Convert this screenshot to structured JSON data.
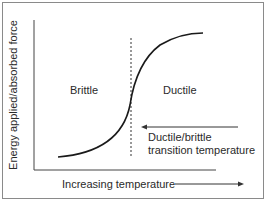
{
  "diagram": {
    "y_axis_label": "Energy applied/absorbed force",
    "x_axis_label": "Increasing temperature",
    "regions": {
      "left": "Brittle",
      "right": "Ductile"
    },
    "annotation": {
      "line1": "Ductile/brittle",
      "line2": "transition temperature"
    },
    "colors": {
      "line": "#1a1a1a",
      "text": "#2a2a2a",
      "frame": "#8a8a8a"
    }
  }
}
